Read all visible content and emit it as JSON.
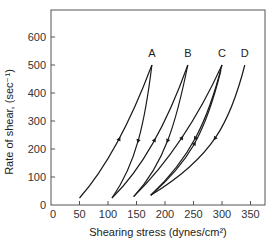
{
  "chart_data": {
    "type": "line",
    "title": "",
    "xlabel": "Shearing stress (dynes/cm²)",
    "ylabel": "Rate of shear, (sec⁻¹)",
    "xlim": [
      0,
      375
    ],
    "ylim": [
      0,
      650
    ],
    "xticks": [
      0,
      50,
      100,
      150,
      200,
      250,
      300,
      350
    ],
    "yticks": [
      0,
      100,
      200,
      300,
      400,
      500,
      600
    ],
    "grid": false,
    "legend": "none",
    "curve_labels": [
      {
        "label": "A",
        "x": 177,
        "y": 530
      },
      {
        "label": "B",
        "x": 240,
        "y": 530
      },
      {
        "label": "C",
        "x": 300,
        "y": 530
      },
      {
        "label": "D",
        "x": 340,
        "y": 530
      }
    ],
    "series": [
      {
        "name": "A up",
        "direction": "up",
        "points": [
          [
            50,
            25
          ],
          [
            100,
            140
          ],
          [
            140,
            300
          ],
          [
            177,
            500
          ]
        ]
      },
      {
        "name": "A down",
        "direction": "down",
        "points": [
          [
            177,
            500
          ],
          [
            165,
            300
          ],
          [
            150,
            150
          ],
          [
            107,
            25
          ]
        ]
      },
      {
        "name": "B up",
        "direction": "up",
        "points": [
          [
            107,
            25
          ],
          [
            160,
            130
          ],
          [
            205,
            300
          ],
          [
            240,
            500
          ]
        ]
      },
      {
        "name": "B down",
        "direction": "down",
        "points": [
          [
            240,
            500
          ],
          [
            220,
            300
          ],
          [
            200,
            150
          ],
          [
            145,
            30
          ]
        ]
      },
      {
        "name": "C up",
        "direction": "up",
        "points": [
          [
            145,
            30
          ],
          [
            205,
            150
          ],
          [
            255,
            300
          ],
          [
            300,
            500
          ]
        ]
      },
      {
        "name": "C down",
        "direction": "down",
        "points": [
          [
            300,
            500
          ],
          [
            275,
            300
          ],
          [
            245,
            170
          ],
          [
            175,
            35
          ]
        ]
      },
      {
        "name": "D down",
        "direction": "down",
        "points": [
          [
            340,
            500
          ],
          [
            315,
            300
          ],
          [
            285,
            170
          ],
          [
            175,
            35
          ]
        ]
      },
      {
        "name": "D-C up",
        "direction": "up",
        "points": [
          [
            175,
            35
          ],
          [
            240,
            150
          ],
          [
            270,
            250
          ],
          [
            298,
            480
          ]
        ]
      }
    ]
  }
}
